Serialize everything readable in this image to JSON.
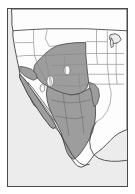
{
  "figure": {
    "kind": "thematic-distribution-map",
    "region": "Western North America (United States and Mexico)",
    "projection_note": "equirectangular-like continental outline",
    "frame": {
      "border_color": "#4a4a4a",
      "border_width_px": 1,
      "left_px": 7,
      "top_px": 8,
      "width_px": 121,
      "height_px": 179
    },
    "colors": {
      "page_background": "#ffffff",
      "ocean_background": "#ececec",
      "land_unshaded": "#fdfdfd",
      "range_shaded": "#9d9d9d",
      "internal_border": "#8a8a8a",
      "coastline": "#3d3d3d",
      "range_outline": "#4f4f4f"
    },
    "legend": {
      "visible": false,
      "shaded_meaning": "distribution / range area",
      "unshaded_meaning": "outside distribution area"
    },
    "labels": {
      "visible": false,
      "note": "no text labels, axis ticks, scale bar or legend text appear in the image"
    },
    "countries": [
      {
        "name": "Canada",
        "shaded": false,
        "note": "only southern sliver visible at top edge"
      },
      {
        "name": "United States",
        "shaded": "partial"
      },
      {
        "name": "Mexico",
        "shaded": "partial"
      }
    ],
    "shaded_areas": [
      "Montana",
      "Wyoming",
      "Colorado",
      "New Mexico",
      "Arizona",
      "southern California",
      "Baja California peninsula",
      "western Texas",
      "Sonora",
      "Chihuahua",
      "Coahuila",
      "Durango",
      "Zacatecas",
      "San Luis Potosi",
      "Nuevo Leon"
    ],
    "unshaded_areas": [
      "Washington",
      "Oregon",
      "Idaho",
      "northern California",
      "Nevada interior pocket",
      "Utah pocket",
      "North Dakota",
      "South Dakota",
      "Nebraska",
      "Kansas",
      "Oklahoma",
      "eastern Texas",
      "Midwest",
      "Great Lakes states",
      "Eastern seaboard"
    ]
  }
}
